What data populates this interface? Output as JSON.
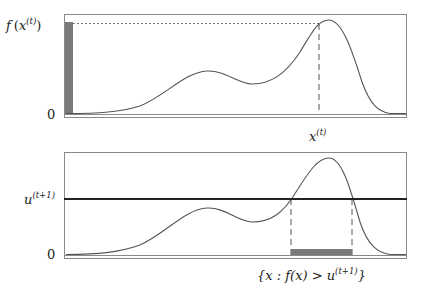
{
  "figure": {
    "colors": {
      "curve": "#555555",
      "frame": "#888888",
      "bar": "#7a7a7a",
      "threshold_line": "#222222",
      "dashed": "#555555"
    },
    "top_panel": {
      "y_label_main": "f",
      "y_label_arg": "x",
      "y_label_sup": "(t)",
      "zero_label": "0",
      "x_label_main": "x",
      "x_label_sup": "(t)"
    },
    "bottom_panel": {
      "threshold_label_main": "u",
      "threshold_label_sup": "(t+1)",
      "zero_label": "0",
      "slice_label_prefix": "{x : f(x) > u",
      "slice_label_sup": "(t+1)",
      "slice_label_suffix": "}"
    }
  }
}
